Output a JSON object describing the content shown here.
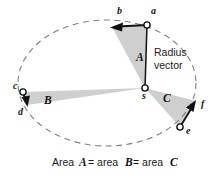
{
  "figure": {
    "title_caption": {
      "segments": [
        {
          "text": "Area ",
          "emphasis": false
        },
        {
          "text": "A",
          "emphasis": true
        },
        {
          "text": " = area ",
          "emphasis": false
        },
        {
          "text": "B",
          "emphasis": true
        },
        {
          "text": " = area ",
          "emphasis": false
        },
        {
          "text": "C",
          "emphasis": true
        }
      ],
      "full_text": "Area A = area B = area C"
    },
    "annotation": {
      "radius_vector_line1": "Radius",
      "radius_vector_line2": "vector"
    },
    "orbit": {
      "shape": "ellipse",
      "stroke_style": "dashed",
      "stroke_color": "#808080",
      "center_x": 107,
      "center_y": 83,
      "radius_x": 89,
      "radius_y": 63
    },
    "focus_point": {
      "label": "s",
      "x": 145,
      "y": 88
    },
    "orbit_points": [
      {
        "label": "a",
        "x": 147,
        "y": 25,
        "label_x": 151,
        "label_y": 14
      },
      {
        "label": "b",
        "x": 112,
        "y": 27,
        "label_x": 117,
        "label_y": 14
      },
      {
        "label": "c",
        "x": 23,
        "y": 92,
        "label_x": 15,
        "label_y": 88
      },
      {
        "label": "d",
        "x": 27,
        "y": 104,
        "label_x": 19,
        "label_y": 113
      },
      {
        "label": "e",
        "x": 180,
        "y": 127,
        "label_x": 187,
        "label_y": 133
      },
      {
        "label": "f",
        "x": 196,
        "y": 101,
        "label_x": 201,
        "label_y": 106
      }
    ],
    "swept_areas": [
      {
        "label": "A",
        "label_x": 138,
        "label_y": 58,
        "vertices": "145,88 147,25 112,27",
        "fill": "#cfcfcf"
      },
      {
        "label": "B",
        "label_x": 47,
        "label_y": 101,
        "vertices": "145,88 23,92 27,105",
        "fill": "#cfcfcf"
      },
      {
        "label": "C",
        "label_x": 165,
        "label_y": 99,
        "vertices": "145,88 196,101 180,127",
        "fill": "#cfcfcf"
      }
    ],
    "velocity_arrows": [
      {
        "name": "arrow-a-to-b",
        "from_x": 147,
        "from_y": 25,
        "to_x": 112,
        "to_y": 27
      },
      {
        "name": "arrow-c-to-d",
        "from_x": 23,
        "from_y": 92,
        "to_x": 27,
        "to_y": 106
      },
      {
        "name": "arrow-e-to-f",
        "from_x": 180,
        "from_y": 127,
        "to_x": 196,
        "to_y": 100
      }
    ],
    "radius_vector_segment": {
      "from_x": 145,
      "from_y": 88,
      "to_x": 147,
      "to_y": 25
    },
    "colors": {
      "background": "#ffffff",
      "orbit_dash": "#808080",
      "area_fill": "#cfcfcf",
      "line": "#111111",
      "text": "#1a1a1a"
    }
  }
}
